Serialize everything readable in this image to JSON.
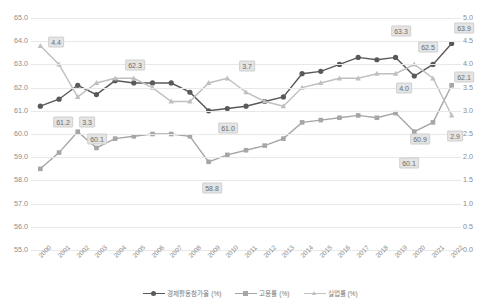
{
  "chart_data": {
    "type": "line",
    "title": "",
    "xlabel": "",
    "ylabel": "",
    "x": [
      "2000",
      "2001",
      "2002",
      "2003",
      "2004",
      "2005",
      "2006",
      "2007",
      "2008",
      "2009",
      "2010",
      "2011",
      "2012",
      "2013",
      "2014",
      "2015",
      "2016",
      "2017",
      "2018",
      "2019",
      "2020",
      "2021",
      "2022"
    ],
    "y_left": {
      "label": "",
      "ylim": [
        55.0,
        65.0
      ],
      "ticks": [
        "65.0",
        "64.0",
        "63.0",
        "62.0",
        "61.0",
        "60.0",
        "59.0",
        "58.0",
        "57.0",
        "56.0",
        "55.0"
      ]
    },
    "y_right": {
      "label": "",
      "ylim": [
        0.0,
        5.0
      ],
      "ticks": [
        "5.0",
        "4.5",
        "4.0",
        "3.5",
        "3.0",
        "2.5",
        "2.0",
        "1.5",
        "1.0",
        "0.5",
        "0.0"
      ]
    },
    "grid": true,
    "legend_position": "bottom",
    "series": [
      {
        "name": "경제활동참가율 (%)",
        "axis": "left",
        "color": "#595959",
        "marker": "circle",
        "values": [
          61.2,
          61.5,
          62.1,
          61.7,
          62.3,
          62.2,
          62.2,
          62.2,
          61.8,
          61.0,
          61.1,
          61.2,
          61.4,
          61.6,
          62.6,
          62.7,
          63.0,
          63.3,
          63.2,
          63.3,
          62.5,
          63.0,
          63.9
        ],
        "data_labels": [
          {
            "x": "2000",
            "value": "61.2"
          },
          {
            "x": "2009",
            "value": "61.0"
          },
          {
            "x": "2019",
            "value": "63.3"
          },
          {
            "x": "2020",
            "value": "62.5"
          },
          {
            "x": "2022",
            "value": "63.9"
          }
        ]
      },
      {
        "name": "고용률 (%)",
        "axis": "left",
        "color": "#a6a6a6",
        "marker": "square",
        "values": [
          58.5,
          59.2,
          60.1,
          59.4,
          59.8,
          59.9,
          60.0,
          60.0,
          59.9,
          58.8,
          59.1,
          59.3,
          59.5,
          59.8,
          60.5,
          60.6,
          60.7,
          60.8,
          60.7,
          60.9,
          60.1,
          60.5,
          62.1
        ],
        "data_labels": [
          {
            "x": "2000",
            "value": "58.5"
          },
          {
            "x": "2002",
            "value": "60.1"
          },
          {
            "x": "2009",
            "value": "58.8"
          },
          {
            "x": "2019",
            "value": "60.9"
          },
          {
            "x": "2020",
            "value": "60.1"
          },
          {
            "x": "2022",
            "value": "62.1"
          }
        ]
      },
      {
        "name": "실업률 (%)",
        "axis": "right",
        "color": "#bfbfbf",
        "marker": "triangle",
        "values": [
          4.4,
          4.0,
          3.3,
          3.6,
          3.7,
          3.7,
          3.5,
          3.2,
          3.2,
          3.6,
          3.7,
          3.4,
          3.2,
          3.1,
          3.5,
          3.6,
          3.7,
          3.7,
          3.8,
          3.8,
          4.0,
          3.7,
          2.9
        ],
        "data_labels": [
          {
            "x": "2000",
            "value": "4.4"
          },
          {
            "x": "2002",
            "value": "3.3"
          },
          {
            "x": "2004",
            "value": "62.3"
          },
          {
            "x": "2010",
            "value": "3.7"
          },
          {
            "x": "2020",
            "value": "4.0"
          },
          {
            "x": "2022",
            "value": "2.9"
          }
        ]
      }
    ],
    "annotations": [
      {
        "text": "4.4",
        "x_px": 56,
        "y_px": 42
      },
      {
        "text": "61.2",
        "x_px": 63,
        "y_px": 122
      },
      {
        "text": "3.3",
        "x_px": 87,
        "y_px": 122
      },
      {
        "text": "62.3",
        "x_px": 135,
        "y_px": 65
      },
      {
        "text": "60.1",
        "x_px": 97,
        "y_px": 139
      },
      {
        "text": "58.8",
        "x_px": 212,
        "y_px": 188
      },
      {
        "text": "3.7",
        "x_px": 247,
        "y_px": 66
      },
      {
        "text": "61.0",
        "x_px": 228,
        "y_px": 128
      },
      {
        "text": "63.3",
        "x_px": 401,
        "y_px": 31
      },
      {
        "text": "62.5",
        "x_px": 428,
        "y_px": 47
      },
      {
        "text": "63.9",
        "x_px": 464,
        "y_px": 28
      },
      {
        "text": "4.0",
        "x_px": 404,
        "y_px": 88
      },
      {
        "text": "60.9",
        "x_px": 420,
        "y_px": 139
      },
      {
        "text": "60.1",
        "x_px": 409,
        "y_px": 163
      },
      {
        "text": "62.1",
        "x_px": 464,
        "y_px": 77
      },
      {
        "text": "2.9",
        "x_px": 455,
        "y_px": 136
      }
    ]
  },
  "footer": {
    "text": ""
  }
}
